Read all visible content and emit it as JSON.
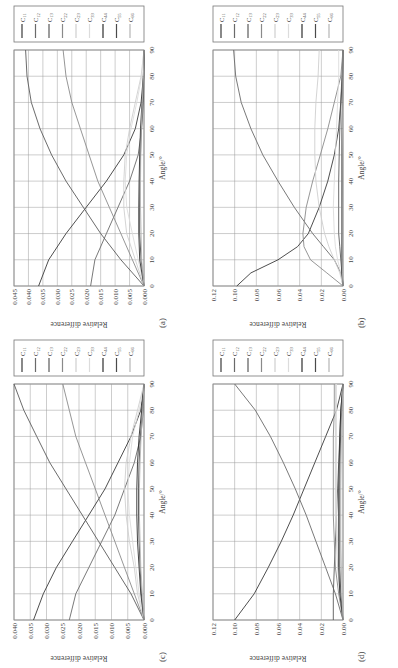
{
  "figure": {
    "legend_labels": [
      "C11",
      "C12",
      "C13",
      "C22",
      "C23",
      "C33",
      "C44",
      "C55",
      "C66"
    ],
    "legend_colors": [
      "#3a3a3a",
      "#6a6a6a",
      "#5a5a5a",
      "#8a8a8a",
      "#cfcfcf",
      "#dcdcdc",
      "#2e2e2e",
      "#4a4a4a",
      "#b5b5b5"
    ],
    "xlabel": "Angle/°",
    "ylabel": "Relative difference"
  },
  "chart_data": [
    {
      "panel": "(a)",
      "type": "line",
      "xlabel": "Angle/°",
      "ylabel": "Relative difference",
      "xlim": [
        0,
        90
      ],
      "ylim": [
        0,
        0.045
      ],
      "xticks": [
        0,
        10,
        20,
        30,
        40,
        50,
        60,
        70,
        80,
        90
      ],
      "yticks": [
        "0.000",
        "0.005",
        "0.010",
        "0.015",
        "0.020",
        "0.025",
        "0.030",
        "0.035",
        "0.040",
        "0.045"
      ],
      "grid": true,
      "legend_position": "right",
      "x": [
        0,
        10,
        20,
        30,
        40,
        50,
        60,
        70,
        80,
        90
      ],
      "series": [
        {
          "name": "C11",
          "values": [
            0.0365,
            0.033,
            0.027,
            0.02,
            0.013,
            0.007,
            0.003,
            0.001,
            0.0002,
            0.0
          ]
        },
        {
          "name": "C12",
          "values": [
            0.0185,
            0.017,
            0.013,
            0.009,
            0.005,
            0.002,
            0.0008,
            0.0002,
            0.0,
            0.0
          ]
        },
        {
          "name": "C13",
          "values": [
            0.0,
            0.008,
            0.015,
            0.021,
            0.027,
            0.032,
            0.036,
            0.039,
            0.0405,
            0.041
          ]
        },
        {
          "name": "C22",
          "values": [
            0.0,
            0.004,
            0.008,
            0.012,
            0.016,
            0.019,
            0.022,
            0.025,
            0.027,
            0.028
          ]
        },
        {
          "name": "C23",
          "values": [
            0.0,
            0.003,
            0.006,
            0.007,
            0.007,
            0.0065,
            0.005,
            0.003,
            0.001,
            0.0
          ]
        },
        {
          "name": "C33",
          "values": [
            0.0,
            0.002,
            0.004,
            0.006,
            0.0065,
            0.006,
            0.0045,
            0.0025,
            0.0008,
            0.0
          ]
        },
        {
          "name": "C44",
          "values": [
            0.0,
            0.0015,
            0.0018,
            0.0018,
            0.0017,
            0.0015,
            0.0012,
            0.0007,
            0.0002,
            0.0
          ]
        },
        {
          "name": "C55",
          "values": [
            0.0,
            0.001,
            0.0015,
            0.0015,
            0.0014,
            0.0012,
            0.0009,
            0.0005,
            0.0001,
            0.0
          ]
        },
        {
          "name": "C66",
          "values": [
            0.0,
            0.0008,
            0.001,
            0.0012,
            0.0012,
            0.0011,
            0.0009,
            0.0006,
            0.0002,
            0.0
          ]
        }
      ]
    },
    {
      "panel": "(b)",
      "type": "line",
      "xlabel": "Angle/°",
      "ylabel": "Relative difference",
      "xlim": [
        0,
        90
      ],
      "ylim": [
        0,
        0.12
      ],
      "xticks": [
        0,
        10,
        20,
        30,
        40,
        50,
        60,
        70,
        80,
        90
      ],
      "yticks": [
        "0.00",
        "0.02",
        "0.04",
        "0.06",
        "0.08",
        "0.10",
        "0.12"
      ],
      "grid": true,
      "legend_position": "right",
      "x": [
        0,
        5,
        10,
        15,
        20,
        30,
        40,
        50,
        60,
        70,
        80,
        90
      ],
      "series": [
        {
          "name": "C11",
          "values": [
            0.098,
            0.085,
            0.06,
            0.042,
            0.032,
            0.022,
            0.014,
            0.008,
            0.004,
            0.002,
            0.0005,
            0.0
          ]
        },
        {
          "name": "C12",
          "values": [
            0.0,
            0.002,
            0.008,
            0.018,
            0.028,
            0.045,
            0.06,
            0.074,
            0.085,
            0.094,
            0.099,
            0.101
          ]
        },
        {
          "name": "C13",
          "values": [
            0.0,
            0.001,
            0.002,
            0.003,
            0.004,
            0.004,
            0.004,
            0.0035,
            0.003,
            0.002,
            0.001,
            0.0
          ]
        },
        {
          "name": "C22",
          "values": [
            0.0,
            0.015,
            0.03,
            0.036,
            0.037,
            0.034,
            0.028,
            0.021,
            0.014,
            0.008,
            0.002,
            0.0
          ]
        },
        {
          "name": "C23",
          "values": [
            0.0,
            0.003,
            0.008,
            0.013,
            0.017,
            0.022,
            0.025,
            0.026,
            0.026,
            0.025,
            0.023,
            0.022
          ]
        },
        {
          "name": "C33",
          "values": [
            0.0,
            0.002,
            0.005,
            0.007,
            0.008,
            0.009,
            0.008,
            0.007,
            0.006,
            0.005,
            0.004,
            0.004
          ]
        },
        {
          "name": "C44",
          "values": [
            0.0,
            0.001,
            0.001,
            0.0012,
            0.0012,
            0.0012,
            0.001,
            0.0009,
            0.0008,
            0.0006,
            0.0004,
            0.0
          ]
        },
        {
          "name": "C55",
          "values": [
            0.0,
            0.0008,
            0.001,
            0.001,
            0.001,
            0.001,
            0.0009,
            0.0008,
            0.0006,
            0.0004,
            0.0002,
            0.0
          ]
        },
        {
          "name": "C66",
          "values": [
            0.0,
            0.0005,
            0.0008,
            0.0009,
            0.001,
            0.001,
            0.0009,
            0.0007,
            0.0005,
            0.0003,
            0.0001,
            0.0
          ]
        }
      ]
    },
    {
      "panel": "(c)",
      "type": "line",
      "xlabel": "Angle/°",
      "ylabel": "Relative difference",
      "xlim": [
        0,
        90
      ],
      "ylim": [
        0,
        0.04
      ],
      "xticks": [
        0,
        10,
        20,
        30,
        40,
        50,
        60,
        70,
        80,
        90
      ],
      "yticks": [
        "0.000",
        "0.005",
        "0.010",
        "0.015",
        "0.020",
        "0.025",
        "0.030",
        "0.035",
        "0.040"
      ],
      "grid": true,
      "legend_position": "right",
      "x": [
        0,
        10,
        20,
        30,
        40,
        50,
        60,
        70,
        80,
        90
      ],
      "series": [
        {
          "name": "C11",
          "values": [
            0.034,
            0.031,
            0.027,
            0.022,
            0.017,
            0.012,
            0.008,
            0.004,
            0.001,
            0.0
          ]
        },
        {
          "name": "C12",
          "values": [
            0.023,
            0.021,
            0.017,
            0.013,
            0.009,
            0.006,
            0.003,
            0.001,
            0.0002,
            0.0
          ]
        },
        {
          "name": "C13",
          "values": [
            0.0,
            0.004,
            0.009,
            0.014,
            0.019,
            0.024,
            0.029,
            0.033,
            0.037,
            0.04
          ]
        },
        {
          "name": "C22",
          "values": [
            0.0,
            0.003,
            0.006,
            0.009,
            0.012,
            0.015,
            0.018,
            0.021,
            0.023,
            0.025
          ]
        },
        {
          "name": "C23",
          "values": [
            0.0,
            0.002,
            0.003,
            0.0045,
            0.0055,
            0.006,
            0.0055,
            0.004,
            0.002,
            0.0
          ]
        },
        {
          "name": "C33",
          "values": [
            0.0,
            0.0015,
            0.0025,
            0.0035,
            0.0045,
            0.005,
            0.0045,
            0.0035,
            0.0015,
            0.0
          ]
        },
        {
          "name": "C44",
          "values": [
            0.0,
            0.001,
            0.0015,
            0.002,
            0.0022,
            0.0022,
            0.002,
            0.0015,
            0.0007,
            0.0
          ]
        },
        {
          "name": "C55",
          "values": [
            0.0,
            0.0008,
            0.0012,
            0.0015,
            0.0017,
            0.0017,
            0.0015,
            0.0011,
            0.0005,
            0.0
          ]
        },
        {
          "name": "C66",
          "values": [
            0.0,
            0.0005,
            0.001,
            0.0012,
            0.0014,
            0.0014,
            0.0012,
            0.0009,
            0.0004,
            0.0
          ]
        }
      ]
    },
    {
      "panel": "(d)",
      "type": "line",
      "xlabel": "Angle/°",
      "ylabel": "Relative difference",
      "xlim": [
        0,
        90
      ],
      "ylim": [
        0,
        0.12
      ],
      "xticks": [
        0,
        10,
        20,
        30,
        40,
        50,
        60,
        70,
        80,
        90
      ],
      "yticks": [
        "0.00",
        "0.02",
        "0.04",
        "0.06",
        "0.08",
        "0.10",
        "0.12"
      ],
      "grid": true,
      "legend_position": "right",
      "x": [
        0,
        10,
        20,
        30,
        40,
        50,
        60,
        70,
        80,
        90
      ],
      "series": [
        {
          "name": "C11",
          "values": [
            0.1,
            0.082,
            0.069,
            0.057,
            0.046,
            0.036,
            0.026,
            0.016,
            0.006,
            0.0
          ]
        },
        {
          "name": "C12",
          "values": [
            0.0,
            0.007,
            0.016,
            0.025,
            0.034,
            0.044,
            0.055,
            0.067,
            0.081,
            0.1
          ]
        },
        {
          "name": "C13",
          "values": [
            0.009,
            0.009,
            0.008,
            0.007,
            0.006,
            0.005,
            0.004,
            0.003,
            0.002,
            0.0
          ]
        },
        {
          "name": "C22",
          "values": [
            0.0,
            0.004,
            0.007,
            0.008,
            0.009,
            0.009,
            0.009,
            0.009,
            0.008,
            0.008
          ]
        },
        {
          "name": "C23",
          "values": [
            0.0,
            0.003,
            0.005,
            0.006,
            0.007,
            0.007,
            0.007,
            0.007,
            0.007,
            0.007
          ]
        },
        {
          "name": "C33",
          "values": [
            0.0,
            0.002,
            0.004,
            0.005,
            0.006,
            0.006,
            0.006,
            0.006,
            0.006,
            0.006
          ]
        },
        {
          "name": "C44",
          "values": [
            0.0,
            0.003,
            0.004,
            0.004,
            0.004,
            0.004,
            0.0035,
            0.003,
            0.002,
            0.0
          ]
        },
        {
          "name": "C55",
          "values": [
            0.0,
            0.002,
            0.003,
            0.003,
            0.003,
            0.003,
            0.0028,
            0.0022,
            0.0012,
            0.0
          ]
        },
        {
          "name": "C66",
          "values": [
            0.0,
            0.001,
            0.0015,
            0.002,
            0.002,
            0.002,
            0.0018,
            0.0014,
            0.0008,
            0.0
          ]
        }
      ]
    }
  ]
}
